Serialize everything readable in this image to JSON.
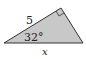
{
  "diagram": {
    "type": "right-triangle",
    "fill_color": "#c8c8c8",
    "stroke_color": "#333333",
    "labels": {
      "hypotenuse_side": "5",
      "angle": "32°",
      "base": "x"
    },
    "right_angle_marker": true
  }
}
